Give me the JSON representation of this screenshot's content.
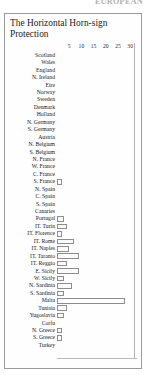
{
  "header": {
    "running_head": "EUROPEAN"
  },
  "figure": {
    "title": "The Horizontal Horn-sign Protection"
  },
  "chart_data": {
    "type": "bar",
    "orientation": "horizontal",
    "title": "The Horizontal Horn-sign Protection",
    "xlabel": "",
    "ylabel": "",
    "xlim": [
      0,
      32
    ],
    "grid": false,
    "legend": null,
    "ticks": [
      5,
      10,
      15,
      20,
      25,
      30
    ],
    "categories": [
      "Scotland",
      "Wales",
      "England",
      "N. Ireland",
      "Eire",
      "Norway",
      "Sweden",
      "Denmark",
      "Holland",
      "N. Germany",
      "S. Germany",
      "Austria",
      "N. Belgium",
      "S. Belgium",
      "N. France",
      "W. France",
      "C. France",
      "S. France",
      "N. Spain",
      "C. Spain",
      "S. Spain",
      "Canaries",
      "Portugal",
      "IT. Turin",
      "IT. Florence",
      "IT. Rome",
      "IT. Naples",
      "IT. Taranto",
      "IT. Reggio",
      "E. Sicily",
      "W. Sicily",
      "N. Sardinia",
      "S. Sardinia",
      "Malta",
      "Tunisia",
      "Yugoslavia",
      "Corfu",
      "N. Greece",
      "S. Greece",
      "Turkey"
    ],
    "values": [
      0,
      0,
      0,
      0,
      0,
      0,
      0,
      0,
      0,
      0,
      0,
      0,
      0,
      0,
      0,
      0,
      0,
      2,
      0,
      0,
      0,
      0,
      3,
      4,
      2,
      7,
      5,
      9,
      4,
      9,
      3,
      6,
      3,
      28,
      4,
      3,
      0,
      2,
      2,
      0
    ]
  }
}
